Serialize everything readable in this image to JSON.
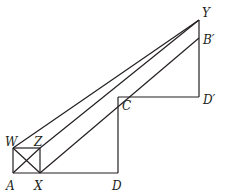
{
  "diagram": {
    "type": "geometry-figure",
    "points": {
      "A": {
        "label": "A",
        "x": 13,
        "y": 173
      },
      "X": {
        "label": "X",
        "x": 40,
        "y": 173
      },
      "D": {
        "label": "D",
        "x": 118,
        "y": 173
      },
      "W": {
        "label": "W",
        "x": 13,
        "y": 148
      },
      "Z": {
        "label": "Z",
        "x": 40,
        "y": 148
      },
      "C": {
        "label": "C",
        "x": 118,
        "y": 97
      },
      "D_prime": {
        "label": "D′",
        "x": 199,
        "y": 97
      },
      "Y": {
        "label": "Y",
        "x": 199,
        "y": 20
      },
      "B_prime": {
        "label": "B′",
        "x": 199,
        "y": 38
      }
    },
    "segments": [
      [
        "A",
        "D"
      ],
      [
        "A",
        "W"
      ],
      [
        "W",
        "Z"
      ],
      [
        "Z",
        "X"
      ],
      [
        "A",
        "Z"
      ],
      [
        "W",
        "X"
      ],
      [
        "D",
        "C"
      ],
      [
        "C",
        "D_prime"
      ],
      [
        "D_prime",
        "Y"
      ],
      [
        "W",
        "Y"
      ],
      [
        "Z",
        "Y"
      ],
      [
        "X",
        "B_prime"
      ]
    ],
    "stroke_color": "#231f20"
  }
}
